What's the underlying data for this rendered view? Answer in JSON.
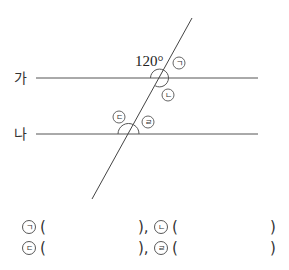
{
  "diagram": {
    "line_labels": {
      "top": "가",
      "bottom": "나"
    },
    "given_angle": "120°",
    "angle_markers": [
      {
        "id": "a",
        "symbol": "ㄱ"
      },
      {
        "id": "b",
        "symbol": "ㄴ"
      },
      {
        "id": "c",
        "symbol": "ㄷ"
      },
      {
        "id": "d",
        "symbol": "ㄹ"
      }
    ],
    "line_color": "#555555"
  },
  "answers": {
    "rows": [
      [
        {
          "symbol": "ㄱ",
          "open": "(",
          "close": "),"
        },
        {
          "symbol": "ㄴ",
          "open": "(",
          "close": ")"
        }
      ],
      [
        {
          "symbol": "ㄷ",
          "open": "(",
          "close": "),"
        },
        {
          "symbol": "ㄹ",
          "open": "(",
          "close": ")"
        }
      ]
    ]
  }
}
